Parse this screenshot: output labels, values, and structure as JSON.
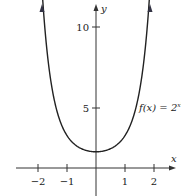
{
  "chart_data": {
    "type": "line",
    "title": "",
    "xlabel": "x",
    "ylabel": "y",
    "function_label": "f(x) = 2^(x^2)",
    "series": [
      {
        "name": "f(x) = 2^(x^2)",
        "x": [
          -1.85,
          -1.5,
          -1.25,
          -1,
          -0.75,
          -0.5,
          -0.25,
          0,
          0.25,
          0.5,
          0.75,
          1,
          1.25,
          1.5,
          1.85
        ],
        "values": [
          10.7,
          4.76,
          2.96,
          2,
          1.48,
          1.19,
          1.04,
          1,
          1.04,
          1.19,
          1.48,
          2,
          2.96,
          4.76,
          10.7
        ]
      }
    ],
    "x_ticks": [
      "-2",
      "-1",
      "1",
      "2"
    ],
    "y_ticks": [
      "5",
      "10"
    ],
    "xlim": [
      -2.7,
      2.9
    ],
    "ylim": [
      -1.7,
      10.4
    ],
    "grid": false,
    "legend": "none"
  },
  "labels": {
    "x_axis": "x",
    "y_axis": "y",
    "func_prefix": "f(x) = 2",
    "func_exp": "x²",
    "xt_m2": "−2",
    "xt_m1": "−1",
    "xt_1": "1",
    "xt_2": "2",
    "yt_5": "5",
    "yt_10": "10"
  }
}
